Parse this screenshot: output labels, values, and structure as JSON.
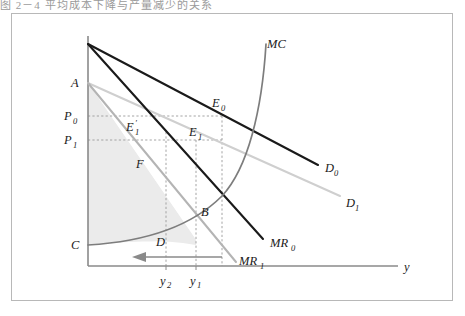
{
  "figure": {
    "caption_strip": "图 2－4   平均成本下降与产量减少的关系",
    "background_color": "#ffffff",
    "frame_color": "#b8b8b8",
    "shade_color": "#ebebeb",
    "dark_line_color": "#1a1a1a",
    "gray_line_color": "#b0b0b0",
    "mid_gray_color": "#8c8c8c",
    "axis_color": "#8a8a8a",
    "dotted_color": "#9a9a9a"
  },
  "axes": {
    "x_label": "y",
    "y_label": "",
    "x_ticks": [
      {
        "label": "y",
        "sub": "2"
      },
      {
        "label": "y",
        "sub": "1"
      }
    ]
  },
  "curves": [
    {
      "id": "D0",
      "label": "D",
      "sub": "0",
      "style": "solid-dark",
      "note": "original demand curve"
    },
    {
      "id": "D1",
      "label": "D",
      "sub": "1",
      "style": "solid-gray",
      "note": "shifted demand curve"
    },
    {
      "id": "MR0",
      "label": "MR",
      "sub": "0",
      "style": "solid-dark",
      "note": "original marginal revenue"
    },
    {
      "id": "MR1",
      "label": "MR",
      "sub": "1",
      "style": "solid-gray",
      "note": "shifted marginal revenue"
    },
    {
      "id": "MC",
      "label": "MC",
      "sub": "",
      "style": "curve-gray",
      "note": "marginal cost curve"
    }
  ],
  "points": [
    {
      "id": "A",
      "label": "A",
      "sub": ""
    },
    {
      "id": "B",
      "label": "B",
      "sub": ""
    },
    {
      "id": "C",
      "label": "C",
      "sub": ""
    },
    {
      "id": "D",
      "label": "D",
      "sub": ""
    },
    {
      "id": "F",
      "label": "F",
      "sub": ""
    },
    {
      "id": "E0",
      "label": "E",
      "sub": "0"
    },
    {
      "id": "E1",
      "label": "E",
      "sub": "1"
    },
    {
      "id": "E1p",
      "label": "E",
      "sub": "1",
      "prime": "′"
    }
  ],
  "price_levels": [
    {
      "id": "P0",
      "label": "P",
      "sub": "0"
    },
    {
      "id": "P1",
      "label": "P",
      "sub": "1"
    }
  ],
  "annotations": {
    "shift_arrow": "leftward output shift arrow from y1 to y2"
  }
}
